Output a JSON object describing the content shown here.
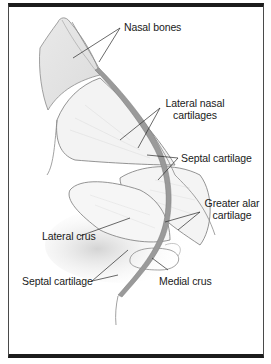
{
  "diagram": {
    "labels": [
      {
        "id": "nasal-bones",
        "text": "Nasal bones"
      },
      {
        "id": "lateral-nasal-cartilages",
        "line1": "Lateral nasal",
        "line2": "cartilages"
      },
      {
        "id": "septal-cartilage-upper",
        "text": "Septal cartilage"
      },
      {
        "id": "greater-alar-cartilage",
        "line1": "Greater alar",
        "line2": "cartilage"
      },
      {
        "id": "lateral-crus",
        "text": "Lateral crus"
      },
      {
        "id": "septal-cartilage-lower",
        "text": "Septal cartilage"
      },
      {
        "id": "medial-crus",
        "text": "Medial crus"
      }
    ],
    "colors": {
      "outline": "#6e6e6e",
      "bone_fill": "#e4e4e4",
      "septum_fill": "#9a9a9a",
      "shadow": "#d8d8d8",
      "frame": "#1c1c1c",
      "text": "#1a1a1a"
    }
  }
}
